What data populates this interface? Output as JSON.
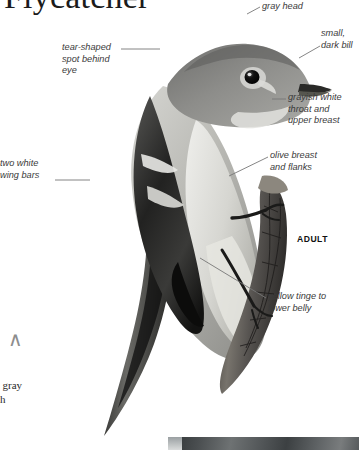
{
  "page": {
    "title": "Flycatcher",
    "background_color": "#ffffff",
    "text_color": "#3a3a3a"
  },
  "plate": {
    "subject": "bird-illustration",
    "stage_label": "ADULT",
    "edge_column_fragment": ", gray\nth"
  },
  "callouts": [
    {
      "id": "gray-head",
      "text": "gray head"
    },
    {
      "id": "small-dark-bill",
      "text": "small,\ndark bill"
    },
    {
      "id": "tear-shaped-spot",
      "text": "tear-shaped\nspot behind\neye"
    },
    {
      "id": "grayish-throat",
      "text": "grayish white\nthroat and\nupper breast"
    },
    {
      "id": "olive-breast",
      "text": "olive breast\nand flanks"
    },
    {
      "id": "two-wing-bars",
      "text": "two white\nwing bars"
    },
    {
      "id": "yellow-tinge",
      "text": "yellow tinge to\nlower belly"
    }
  ]
}
